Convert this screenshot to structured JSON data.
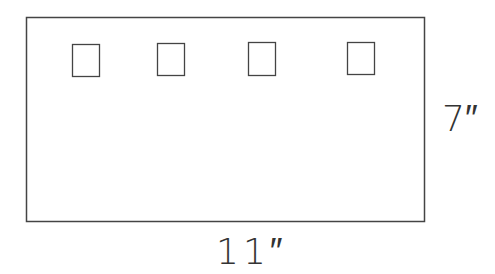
{
  "diagram": {
    "stroke_color": "#444444",
    "background": "#ffffff",
    "outer_rect": {
      "x": 26,
      "y": 17,
      "width": 399,
      "height": 204
    },
    "small_boxes": [
      {
        "x": 72,
        "y": 44,
        "width": 28,
        "height": 32
      },
      {
        "x": 157,
        "y": 43,
        "width": 27,
        "height": 32
      },
      {
        "x": 248,
        "y": 42,
        "width": 28,
        "height": 33
      },
      {
        "x": 347,
        "y": 42,
        "width": 27,
        "height": 32
      }
    ],
    "labels": {
      "height": "7″",
      "width": "11″"
    }
  }
}
